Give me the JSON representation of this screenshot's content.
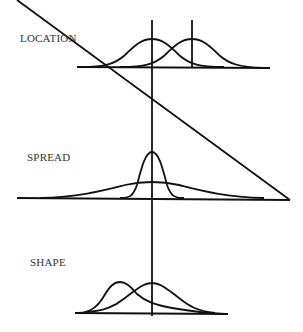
{
  "panels": [
    {
      "id": "location",
      "label": "LOCATION"
    },
    {
      "id": "spread",
      "label": "SPREAD"
    },
    {
      "id": "shape",
      "label": "SHAPE"
    }
  ],
  "colors": {
    "line": "#111111",
    "text": "#333333",
    "background": "#ffffff"
  }
}
